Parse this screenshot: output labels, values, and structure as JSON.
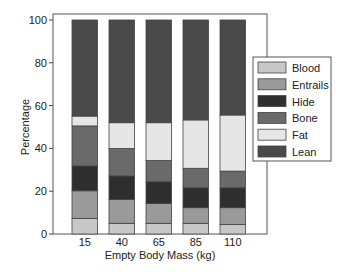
{
  "chart_data": {
    "type": "bar",
    "stacked": true,
    "title": "",
    "xlabel": "Empty Body Mass (kg)",
    "ylabel": "Percentage",
    "ylim": [
      0,
      100
    ],
    "yticks": [
      0,
      20,
      40,
      60,
      80,
      100
    ],
    "grid": false,
    "legend_position": "right",
    "categories": [
      "15",
      "40",
      "65",
      "85",
      "110"
    ],
    "series": [
      {
        "name": "Blood",
        "color": "#c8c8c8",
        "values": [
          7.3,
          5.0,
          5.0,
          5.0,
          4.5
        ]
      },
      {
        "name": "Entrails",
        "color": "#9a9a9a",
        "values": [
          12.9,
          11.2,
          9.3,
          7.3,
          7.8
        ]
      },
      {
        "name": "Hide",
        "color": "#2e2e2e",
        "values": [
          11.6,
          10.9,
          10.1,
          9.3,
          9.3
        ]
      },
      {
        "name": "Bone",
        "color": "#6a6a6a",
        "values": [
          18.7,
          12.9,
          10.0,
          9.1,
          7.8
        ]
      },
      {
        "name": "Fat",
        "color": "#e6e6e6",
        "values": [
          4.6,
          12.0,
          17.6,
          22.6,
          26.2
        ]
      },
      {
        "name": "Lean",
        "color": "#4a4a4a",
        "values": [
          44.9,
          48.0,
          48.0,
          46.7,
          44.4
        ]
      }
    ]
  }
}
